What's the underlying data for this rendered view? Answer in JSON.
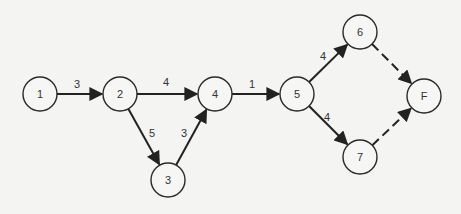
{
  "diagram": {
    "type": "activity-network",
    "nodes": [
      {
        "id": "1",
        "label": "1",
        "x": 40,
        "y": 94
      },
      {
        "id": "2",
        "label": "2",
        "x": 120,
        "y": 94
      },
      {
        "id": "3",
        "label": "3",
        "x": 168,
        "y": 180
      },
      {
        "id": "4",
        "label": "4",
        "x": 215,
        "y": 94
      },
      {
        "id": "5",
        "label": "5",
        "x": 297,
        "y": 94
      },
      {
        "id": "6",
        "label": "6",
        "x": 360,
        "y": 32
      },
      {
        "id": "7",
        "label": "7",
        "x": 360,
        "y": 157
      },
      {
        "id": "F",
        "label": "F",
        "x": 424,
        "y": 96
      }
    ],
    "edges": [
      {
        "from": "1",
        "to": "2",
        "weight": "3",
        "style": "solid",
        "lx": 77,
        "ly": 88
      },
      {
        "from": "2",
        "to": "4",
        "weight": "4",
        "style": "solid",
        "lx": 166,
        "ly": 86
      },
      {
        "from": "2",
        "to": "3",
        "weight": "5",
        "style": "solid",
        "lx": 152,
        "ly": 137
      },
      {
        "from": "3",
        "to": "4",
        "weight": "3",
        "style": "solid",
        "lx": 184,
        "ly": 137
      },
      {
        "from": "4",
        "to": "5",
        "weight": "1",
        "style": "solid",
        "lx": 252,
        "ly": 88
      },
      {
        "from": "5",
        "to": "6",
        "weight": "4",
        "style": "solid",
        "lx": 323,
        "ly": 60
      },
      {
        "from": "5",
        "to": "7",
        "weight": "4",
        "style": "solid",
        "lx": 327,
        "ly": 121
      },
      {
        "from": "6",
        "to": "F",
        "weight": "",
        "style": "dashed"
      },
      {
        "from": "7",
        "to": "F",
        "weight": "",
        "style": "dashed"
      }
    ]
  }
}
